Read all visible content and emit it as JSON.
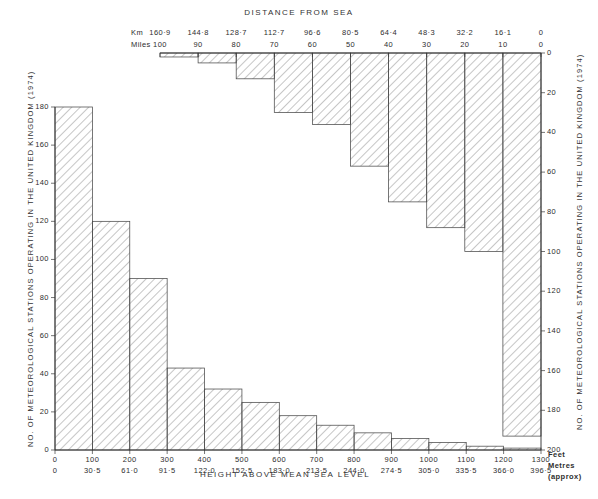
{
  "figure": {
    "top_title": "DISTANCE FROM SEA",
    "bottom_title": "HEIGHT ABOVE MEAN SEA LEVEL",
    "left_axis_title": "NO. OF METEOROLOGICAL STATIONS OPERATING IN THE UNITED KINGDOM (1974)",
    "right_axis_title": "NO. OF METEOROLOGICAL STATIONS OPERATING IN THE UNITED KINGDOM (1974)",
    "km_row_label": "Km",
    "miles_row_label": "Miles",
    "feet_unit_label": "Feet",
    "metres_unit_label": "Metres",
    "metres_approx_label": "(approx)",
    "ink": "#333333",
    "hatch": "#8d8d8d",
    "outline": "#4a4a4a"
  },
  "chart_data": [
    {
      "type": "bar",
      "id": "distance-from-sea",
      "title": "DISTANCE FROM SEA",
      "orientation": "descending-from-top",
      "xlabel": "",
      "ylabel": "NO. OF METEOROLOGICAL STATIONS OPERATING IN THE UNITED KINGDOM (1974)",
      "x_tick_labels_km": [
        "160·9",
        "144·8",
        "128·7",
        "112·7",
        "96·6",
        "80·5",
        "64·4",
        "48·3",
        "32·2",
        "16·1",
        "0"
      ],
      "x_tick_labels_miles": [
        "100",
        "90",
        "80",
        "70",
        "60",
        "50",
        "40",
        "30",
        "20",
        "10",
        "0"
      ],
      "categories": [
        "160·9–144·8",
        "144·8–128·7",
        "128·7–112·7",
        "112·7–96·6",
        "96·6–80·5",
        "80·5–64·4",
        "64·4–48·3",
        "48·3–32·2",
        "32·2–16·1",
        "16·1–0"
      ],
      "categories_miles": [
        "100–90",
        "90–80",
        "80–70",
        "70–60",
        "60–50",
        "50–40",
        "40–30",
        "30–20",
        "20–10",
        "10–0"
      ],
      "values": [
        2,
        5,
        13,
        30,
        36,
        57,
        75,
        88,
        100,
        193
      ],
      "ylim": [
        0,
        200
      ],
      "y_tick_labels": [
        "0",
        "20",
        "40",
        "60",
        "80",
        "100",
        "120",
        "140",
        "160",
        "180",
        "200"
      ],
      "grid": false,
      "legend": "none"
    },
    {
      "type": "bar",
      "id": "height-above-sea-level",
      "title": "HEIGHT ABOVE MEAN SEA LEVEL",
      "orientation": "vertical",
      "xlabel": "HEIGHT ABOVE MEAN SEA LEVEL",
      "ylabel": "NO. OF METEOROLOGICAL STATIONS OPERATING IN THE UNITED KINGDOM (1974)",
      "x_tick_labels_feet": [
        "0",
        "100",
        "200",
        "300",
        "400",
        "500",
        "600",
        "700",
        "800",
        "900",
        "1000",
        "1100",
        "1200",
        "1300"
      ],
      "x_tick_labels_metres": [
        "0",
        "30·5",
        "61·0",
        "91·5",
        "122·0",
        "152·5",
        "183·0",
        "213·5",
        "244·0",
        "274·5",
        "305·0",
        "335·5",
        "366·0",
        "396·5"
      ],
      "categories": [
        "0–100",
        "100–200",
        "200–300",
        "300–400",
        "400–500",
        "500–600",
        "600–700",
        "700–800",
        "800–900",
        "900–1000",
        "1000–1100",
        "1100–1200",
        "1200–1300"
      ],
      "values": [
        180,
        120,
        90,
        43,
        32,
        25,
        18,
        13,
        9,
        6,
        4,
        2,
        1
      ],
      "ylim": [
        0,
        180
      ],
      "y_tick_labels": [
        "0",
        "20",
        "40",
        "60",
        "80",
        "100",
        "120",
        "140",
        "160",
        "180"
      ],
      "grid": false,
      "legend": "none"
    }
  ]
}
